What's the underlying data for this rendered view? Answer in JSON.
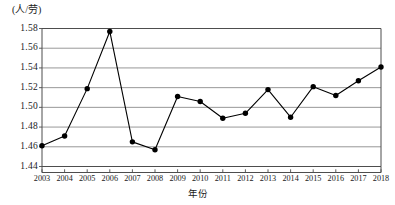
{
  "chart_data": {
    "type": "line",
    "title": "",
    "subtitle": "",
    "unit_label": "(人/劳)",
    "xlabel": "年份",
    "ylabel": "",
    "categories": [
      2003,
      2004,
      2005,
      2006,
      2007,
      2008,
      2009,
      2010,
      2011,
      2012,
      2013,
      2014,
      2015,
      2016,
      2017,
      2018
    ],
    "x": [
      "2003",
      "2004",
      "2005",
      "2006",
      "2007",
      "2008",
      "2009",
      "2010",
      "2011",
      "2012",
      "2013",
      "2014",
      "2015",
      "2016",
      "2017",
      "2018"
    ],
    "values": [
      1.461,
      1.471,
      1.519,
      1.577,
      1.465,
      1.457,
      1.511,
      1.506,
      1.489,
      1.494,
      1.518,
      1.49,
      1.521,
      1.512,
      1.527,
      1.541
    ],
    "series": [
      {
        "name": "",
        "values": [
          1.461,
          1.471,
          1.519,
          1.577,
          1.465,
          1.457,
          1.511,
          1.506,
          1.489,
          1.494,
          1.518,
          1.49,
          1.521,
          1.512,
          1.527,
          1.541
        ]
      }
    ],
    "ylim": [
      1.44,
      1.58
    ],
    "yticks": [
      "1.44",
      "1.46",
      "1.48",
      "1.50",
      "1.52",
      "1.54",
      "1.56",
      "1.58"
    ],
    "ytick_values": [
      1.44,
      1.46,
      1.48,
      1.5,
      1.52,
      1.54,
      1.56,
      1.58
    ],
    "xtick_labels": [
      "2003",
      "2004",
      "2005",
      "2006",
      "2007",
      "2008",
      "2009",
      "2010",
      "2011",
      "2012",
      "2013",
      "2014",
      "2015",
      "2016",
      "2017",
      "2018"
    ],
    "grid": true,
    "grid_axis": "y",
    "legend": false,
    "legend_position": "none",
    "marker": "filled-circle",
    "line_color": "#000000",
    "marker_color": "#000000",
    "grid_color": "#8c8c8c",
    "axis_color": "#4d4d4d",
    "annotations": []
  }
}
